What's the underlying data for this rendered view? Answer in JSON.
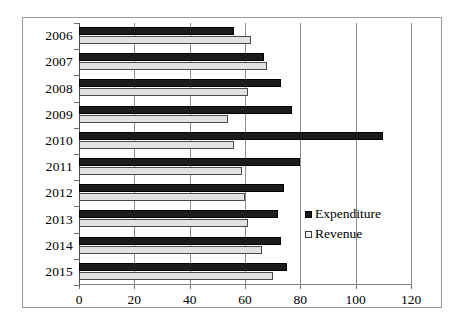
{
  "chart_data": {
    "type": "bar",
    "orientation": "horizontal",
    "title": "",
    "xlabel": "",
    "ylabel": "",
    "categories": [
      "2006",
      "2007",
      "2008",
      "2009",
      "2010",
      "2011",
      "2012",
      "2013",
      "2014",
      "2015"
    ],
    "series": [
      {
        "name": "Expenditure",
        "color": "#1c1c1c",
        "values": [
          56,
          67,
          73,
          77,
          110,
          80,
          74,
          72,
          73,
          75
        ]
      },
      {
        "name": "Revenue",
        "color": "#e2e2e2",
        "values": [
          62,
          68,
          61,
          54,
          56,
          59,
          60,
          61,
          66,
          70
        ]
      }
    ],
    "xlim": [
      0,
      120
    ],
    "xticks": [
      0,
      20,
      40,
      60,
      80,
      100,
      120
    ],
    "xtick_labels": [
      "0",
      "20",
      "40",
      "60",
      "80",
      "100",
      "120"
    ],
    "grid": "vertical",
    "legend_position": "inside-right"
  },
  "legend": {
    "entries": [
      {
        "label": "Expenditure",
        "swatch": "filled-dark-square"
      },
      {
        "label": "Revenue",
        "swatch": "outlined-light-square"
      }
    ]
  },
  "colors": {
    "expenditure": "#1c1c1c",
    "revenue": "#e2e2e2",
    "gridline": "#8c8c8c",
    "axis": "#555555",
    "frame_border": "#9a9a9a",
    "background": "#ffffff"
  }
}
